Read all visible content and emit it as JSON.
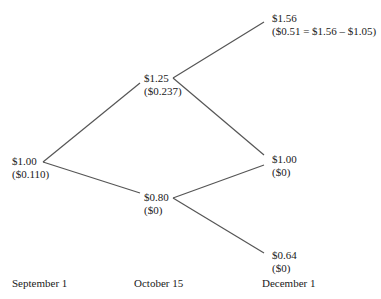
{
  "tree": {
    "nodes": {
      "root": {
        "price": "$1.00",
        "value": "($0.110)"
      },
      "up": {
        "price": "$1.25",
        "value": "($0.237)"
      },
      "down": {
        "price": "$0.80",
        "value": "($0)"
      },
      "upup": {
        "price": "$1.56",
        "value": "($0.51 = $1.56 – $1.05)"
      },
      "updown": {
        "price": "$1.00",
        "value": "($0)"
      },
      "downdown": {
        "price": "$0.64",
        "value": "($0)"
      }
    },
    "dates": [
      "September 1",
      "October 15",
      "December 1"
    ],
    "line_color": "#555555"
  }
}
